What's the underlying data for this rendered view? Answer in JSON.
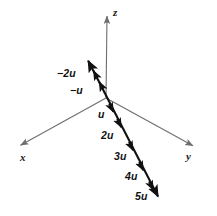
{
  "figure": {
    "colors": {
      "axis": "#6e6e6e",
      "vector": "#111111",
      "background": "#ffffff",
      "text": "#1a1a1a"
    },
    "origin": {
      "x": 106,
      "y": 98
    },
    "axes": [
      {
        "name": "x",
        "label": "x",
        "label_x": 20,
        "label_y": 152,
        "from": {
          "x": 106,
          "y": 98
        },
        "to": {
          "x": 17,
          "y": 147
        },
        "arrow": "end"
      },
      {
        "name": "y",
        "label": "y",
        "label_x": 186,
        "label_y": 151,
        "from": {
          "x": 106,
          "y": 98
        },
        "to": {
          "x": 197,
          "y": 148
        },
        "arrow": "end"
      },
      {
        "name": "z",
        "label": "z",
        "label_x": 113,
        "label_y": 7,
        "from": {
          "x": 106,
          "y": 98
        },
        "to": {
          "x": 107,
          "y": 12
        },
        "arrow": "end"
      }
    ],
    "vector_line": {
      "name": "vector-u-line",
      "from": {
        "x": 86,
        "y": 57
      },
      "to": {
        "x": 161,
        "y": 201
      },
      "arrow": "both"
    },
    "vector_labels": [
      {
        "name": "label-neg-2u",
        "text": "−2u",
        "x": 57,
        "y": 68,
        "tick_x": 93,
        "tick_y": 71
      },
      {
        "name": "label-neg-u",
        "text": "−u",
        "x": 70,
        "y": 85,
        "tick_x": 99,
        "tick_y": 85
      },
      {
        "name": "label-u",
        "text": "u",
        "x": 98,
        "y": 109,
        "tick_x": 113,
        "tick_y": 112
      },
      {
        "name": "label-2u",
        "text": "2u",
        "x": 101,
        "y": 130,
        "tick_x": 121,
        "tick_y": 127
      },
      {
        "name": "label-3u",
        "text": "3u",
        "x": 114,
        "y": 151,
        "tick_x": 133,
        "tick_y": 150
      },
      {
        "name": "label-4u",
        "text": "4u",
        "x": 125,
        "y": 171,
        "tick_x": 143,
        "tick_y": 171
      },
      {
        "name": "label-5u",
        "text": "5u",
        "x": 135,
        "y": 191,
        "tick_x": 153,
        "tick_y": 190
      }
    ]
  }
}
